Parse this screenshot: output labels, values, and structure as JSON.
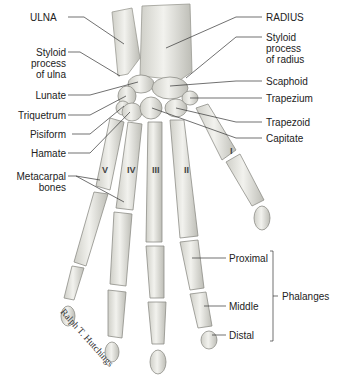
{
  "labels": {
    "ulna": "ULNA",
    "radius": "RADIUS",
    "styloid_ulna": [
      "Styloid",
      "process",
      "of ulna"
    ],
    "styloid_radius": [
      "Styloid",
      "process",
      "of radius"
    ],
    "lunate": "Lunate",
    "triquetrum": "Triquetrum",
    "pisiform": "Pisiform",
    "hamate": "Hamate",
    "metacarpal": [
      "Metacarpal",
      "bones"
    ],
    "scaphoid": "Scaphoid",
    "trapezium": "Trapezium",
    "trapezoid": "Trapezoid",
    "capitate": "Capitate",
    "proximal": "Proximal",
    "middle": "Middle",
    "distal": "Distal",
    "phalanges": "Phalanges"
  },
  "metacarpal_numerals": [
    "I",
    "II",
    "III",
    "IV",
    "V"
  ],
  "credit": "Ralph T. Hutchings",
  "colors": {
    "bone": "#e9e9e4",
    "bone_shadow": "#b9b9b2",
    "leader": "#333333",
    "text": "#222222"
  }
}
